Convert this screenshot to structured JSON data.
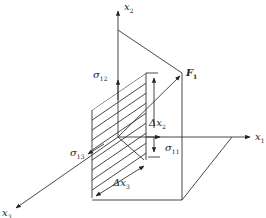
{
  "diagram": {
    "type": "stress-element-3d",
    "colors": {
      "stroke": "#333333",
      "background": "#ffffff"
    },
    "axes": [
      {
        "id": "x1",
        "label": "x",
        "sub": "1"
      },
      {
        "id": "x2",
        "label": "x",
        "sub": "2"
      },
      {
        "id": "x3",
        "label": "x",
        "sub": "3"
      }
    ],
    "stresses": [
      {
        "id": "s11",
        "label": "σ",
        "sub": "11"
      },
      {
        "id": "s12",
        "label": "σ",
        "sub": "12"
      },
      {
        "id": "s13",
        "label": "σ",
        "sub": "13"
      }
    ],
    "increments": [
      {
        "id": "dx2",
        "label": "Δx",
        "sub": "2"
      },
      {
        "id": "dx3",
        "label": "Δx",
        "sub": "3"
      }
    ],
    "force": {
      "label": "F",
      "sub": "1"
    }
  }
}
